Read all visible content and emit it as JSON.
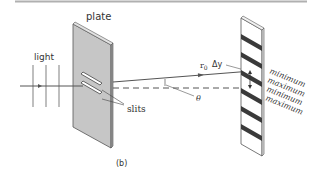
{
  "figure": {
    "panel_label": "(b)",
    "labels": {
      "plate": "plate",
      "light": "light",
      "slits": "slits",
      "r0": "r",
      "r0_sub": "0",
      "delta_y": "Δy",
      "theta": "θ",
      "y": "y"
    },
    "screen_labels": [
      "minimum",
      "maximum",
      "minimum",
      "maximum"
    ],
    "colors": {
      "plate_fill": "#c8c8c8",
      "plate_edge": "#555555",
      "stripe": "#3a3a3a",
      "line": "#555555",
      "top_rule": "#aaaaaa"
    }
  }
}
